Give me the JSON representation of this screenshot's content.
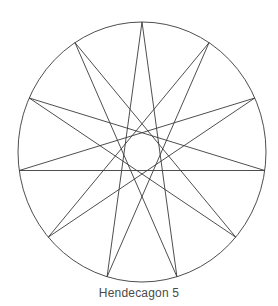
{
  "caption": "Hendecagon 5",
  "diagram": {
    "shape": "star-polygon",
    "notation": "{11/5}",
    "vertices": 11,
    "step": 5,
    "circle": {
      "cx": 142,
      "cy": 152,
      "rx": 124,
      "ry": 130
    },
    "stroke_color": "#3a3a3a",
    "stroke_width": 0.9
  }
}
